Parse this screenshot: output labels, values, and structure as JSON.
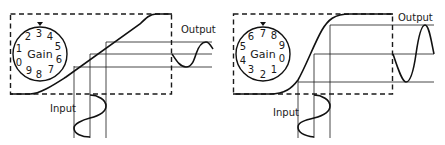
{
  "panels": [
    {
      "id": "low-gain",
      "dial": {
        "label": "Gain",
        "numbers": [
          "0",
          "1",
          "2",
          "3",
          "4",
          "5",
          "6",
          "7",
          "8",
          "9"
        ],
        "pointer_at": "3"
      },
      "input_label": "Input",
      "output_label": "Output",
      "description": "Low gain setting: input sine maps through linear region of transfer curve to small output sine"
    },
    {
      "id": "high-gain",
      "dial": {
        "label": "Gain",
        "numbers": [
          "0",
          "1",
          "2",
          "3",
          "4",
          "5",
          "6",
          "7",
          "8",
          "9"
        ],
        "pointer_at": "7"
      },
      "input_label": "Input",
      "output_label": "Output",
      "description": "High gain setting: steep transfer curve produces large output sine"
    }
  ]
}
